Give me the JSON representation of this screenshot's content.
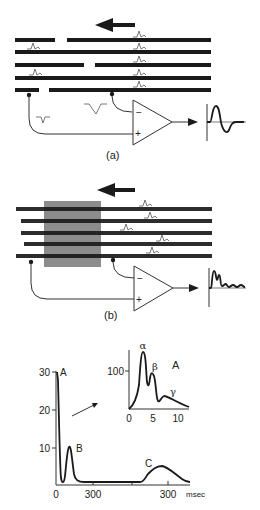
{
  "panel_a": {
    "label": "(a)",
    "direction_arrow": "left",
    "amp_minus": "−",
    "amp_plus": "+",
    "output_waveform": "biphasic"
  },
  "panel_b": {
    "label": "(b)",
    "direction_arrow": "left",
    "amp_minus": "−",
    "amp_plus": "+",
    "output_waveform": "compound-monophasic",
    "block_color": "#8c8c8c"
  },
  "panel_c": {
    "main_plot": {
      "y_ticks": [
        "30",
        "20",
        "10"
      ],
      "x_ticks": [
        "0",
        "300",
        "300"
      ],
      "x_unit": "msec",
      "peak_labels": [
        "A",
        "B",
        "C"
      ]
    },
    "inset_plot": {
      "title": "A",
      "y_ticks": [
        "100"
      ],
      "x_ticks": [
        "0",
        "5",
        "10"
      ],
      "peak_labels": [
        "α",
        "β",
        "γ"
      ]
    }
  },
  "colors": {
    "ink": "#1a1a1a",
    "background": "#ffffff",
    "shade": "#8c8c8c"
  }
}
